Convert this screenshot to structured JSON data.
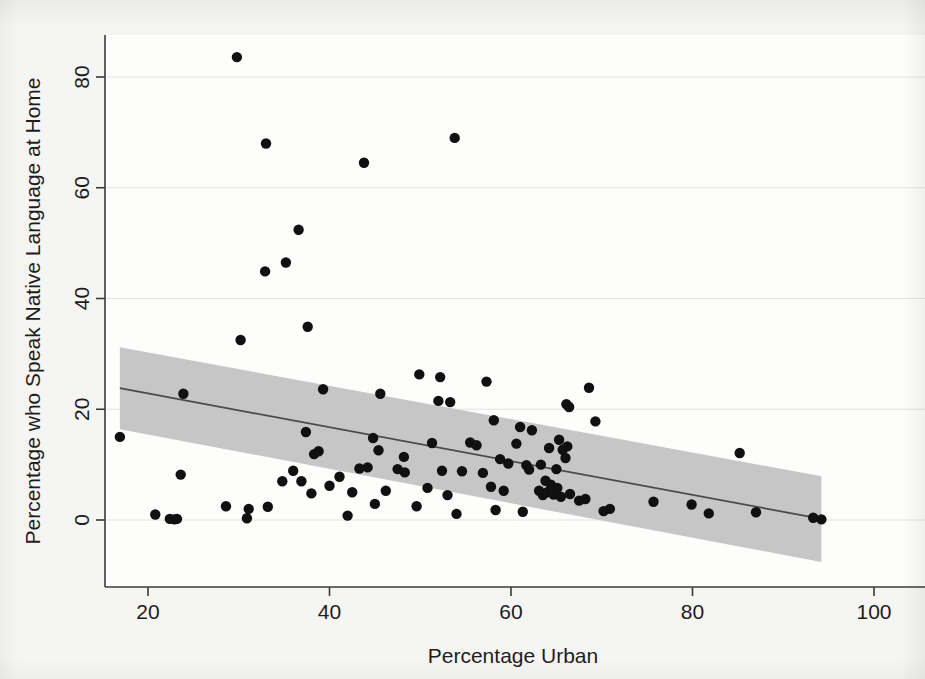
{
  "chart_data": {
    "type": "scatter",
    "title": "",
    "xlabel": "Percentage Urban",
    "ylabel": "Percentage who Speak Native Language at Home",
    "xlim": [
      16,
      102
    ],
    "ylim": [
      -10,
      88
    ],
    "xticks": [
      20,
      40,
      60,
      80,
      100
    ],
    "yticks": [
      0,
      20,
      40,
      60,
      80
    ],
    "xtick_labels": [
      "20",
      "40",
      "60",
      "80",
      "100"
    ],
    "ytick_labels": [
      "0",
      "20",
      "40",
      "60",
      "80"
    ],
    "grid": true,
    "legend": "none",
    "marker_color": "#101010",
    "fit_line_color": "#4a4a4a",
    "ci_band_color": "#c3c3c3",
    "series": [
      {
        "name": "Countries",
        "points": [
          [
            29.8,
            83.6
          ],
          [
            33.0,
            68.0
          ],
          [
            53.8,
            69.0
          ],
          [
            43.8,
            64.5
          ],
          [
            36.6,
            52.4
          ],
          [
            35.2,
            46.5
          ],
          [
            32.9,
            44.9
          ],
          [
            37.6,
            34.9
          ],
          [
            30.2,
            32.5
          ],
          [
            49.9,
            26.3
          ],
          [
            52.2,
            25.8
          ],
          [
            57.3,
            25.0
          ],
          [
            68.6,
            23.9
          ],
          [
            23.9,
            22.8
          ],
          [
            45.6,
            22.8
          ],
          [
            39.3,
            23.6
          ],
          [
            53.3,
            21.3
          ],
          [
            52.0,
            21.5
          ],
          [
            66.1,
            20.9
          ],
          [
            66.4,
            20.4
          ],
          [
            69.3,
            17.8
          ],
          [
            16.9,
            15.0
          ],
          [
            37.4,
            15.9
          ],
          [
            44.8,
            14.8
          ],
          [
            51.3,
            13.9
          ],
          [
            55.5,
            14.0
          ],
          [
            56.2,
            13.5
          ],
          [
            58.1,
            18.0
          ],
          [
            60.6,
            13.8
          ],
          [
            61.0,
            16.8
          ],
          [
            62.3,
            16.2
          ],
          [
            64.2,
            13.0
          ],
          [
            65.3,
            14.5
          ],
          [
            65.7,
            12.7
          ],
          [
            66.2,
            13.3
          ],
          [
            66.0,
            11.2
          ],
          [
            85.2,
            12.1
          ],
          [
            45.4,
            12.6
          ],
          [
            48.2,
            11.4
          ],
          [
            38.8,
            12.4
          ],
          [
            38.3,
            11.9
          ],
          [
            58.8,
            11.0
          ],
          [
            59.7,
            10.2
          ],
          [
            61.7,
            9.9
          ],
          [
            63.3,
            10.0
          ],
          [
            65.0,
            9.2
          ],
          [
            23.6,
            8.2
          ],
          [
            43.3,
            9.3
          ],
          [
            44.2,
            9.5
          ],
          [
            47.5,
            9.2
          ],
          [
            48.3,
            8.6
          ],
          [
            52.4,
            8.9
          ],
          [
            54.6,
            8.8
          ],
          [
            56.9,
            8.5
          ],
          [
            62.0,
            9.1
          ],
          [
            63.8,
            7.1
          ],
          [
            64.4,
            6.4
          ],
          [
            65.1,
            5.8
          ],
          [
            64.7,
            4.6
          ],
          [
            65.5,
            4.2
          ],
          [
            66.5,
            4.7
          ],
          [
            63.5,
            4.5
          ],
          [
            63.1,
            5.3
          ],
          [
            64.0,
            5.0
          ],
          [
            41.1,
            7.8
          ],
          [
            40.0,
            6.2
          ],
          [
            42.5,
            5.0
          ],
          [
            46.2,
            5.3
          ],
          [
            50.8,
            5.8
          ],
          [
            53.0,
            4.5
          ],
          [
            57.8,
            6.0
          ],
          [
            59.2,
            5.3
          ],
          [
            36.0,
            8.9
          ],
          [
            36.9,
            7.0
          ],
          [
            38.0,
            4.8
          ],
          [
            34.8,
            7.0
          ],
          [
            33.2,
            2.4
          ],
          [
            31.1,
            2.0
          ],
          [
            28.6,
            2.5
          ],
          [
            42.0,
            0.8
          ],
          [
            45.0,
            2.9
          ],
          [
            49.6,
            2.5
          ],
          [
            54.0,
            1.1
          ],
          [
            58.3,
            1.8
          ],
          [
            61.3,
            1.5
          ],
          [
            67.5,
            3.5
          ],
          [
            68.2,
            3.8
          ],
          [
            70.2,
            1.6
          ],
          [
            70.9,
            2.0
          ],
          [
            75.7,
            3.3
          ],
          [
            79.9,
            2.8
          ],
          [
            81.8,
            1.2
          ],
          [
            87.0,
            1.4
          ],
          [
            93.3,
            0.4
          ],
          [
            94.2,
            0.1
          ],
          [
            20.8,
            1.0
          ],
          [
            22.4,
            0.2
          ],
          [
            22.9,
            0.1
          ],
          [
            23.2,
            0.2
          ],
          [
            30.9,
            0.3
          ]
        ]
      }
    ],
    "fit_line": {
      "x_start": 16.9,
      "y_start": 23.8,
      "x_end": 94.2,
      "y_end": 0.2
    },
    "ci_band": {
      "x_start": 16.9,
      "upper_start": 31.2,
      "lower_start": 16.4,
      "x_end": 94.2,
      "upper_end": 7.9,
      "lower_end": -7.6
    }
  }
}
